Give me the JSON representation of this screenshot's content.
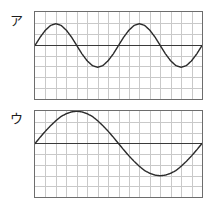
{
  "figure": {
    "background_color": "#ffffff",
    "width": 213,
    "height": 207,
    "panel_count": 2
  },
  "style": {
    "grid_color": "#c9c9c9",
    "border_color": "#6d6d6d",
    "axis_color": "#3a3a3a",
    "wave_color": "#2b2b2b",
    "label_color": "#1c1c1c"
  },
  "panels": [
    {
      "label": "ア",
      "label_x": 10,
      "label_y": 14,
      "box_x": 34,
      "box_y": 11,
      "box_w": 169,
      "box_h": 89,
      "grid_cols": 16,
      "grid_rows": 8,
      "axis_row": 3,
      "chart_data": {
        "type": "line",
        "title": "ア",
        "xlabel": "",
        "ylabel": "",
        "waveform": "sine",
        "cycles": 2,
        "amplitude_cells": 2,
        "phase_deg": 0,
        "baseline_row": 3,
        "xlim": [
          0,
          16
        ],
        "ylim": [
          -3,
          5
        ],
        "grid": true,
        "legend": "none",
        "x": [
          0,
          0.5,
          1,
          1.5,
          2,
          2.5,
          3,
          3.5,
          4,
          4.5,
          5,
          5.5,
          6,
          6.5,
          7,
          7.5,
          8,
          8.5,
          9,
          9.5,
          10,
          10.5,
          11,
          11.5,
          12,
          12.5,
          13,
          13.5,
          14,
          14.5,
          15,
          15.5,
          16
        ],
        "y": [
          0,
          0.77,
          1.41,
          1.85,
          2,
          1.85,
          1.41,
          0.77,
          0,
          -0.77,
          -1.41,
          -1.85,
          -2,
          -1.85,
          -1.41,
          -0.77,
          0,
          0.77,
          1.41,
          1.85,
          2,
          1.85,
          1.41,
          0.77,
          0,
          -0.77,
          -1.41,
          -1.85,
          -2,
          -1.85,
          -1.41,
          -0.77,
          0
        ]
      }
    },
    {
      "label": "ウ",
      "label_x": 10,
      "label_y": 112,
      "box_x": 34,
      "box_y": 110,
      "box_w": 169,
      "box_h": 88,
      "grid_cols": 16,
      "grid_rows": 8,
      "axis_row": 3,
      "chart_data": {
        "type": "line",
        "title": "ウ",
        "xlabel": "",
        "ylabel": "",
        "waveform": "sine",
        "cycles": 1,
        "amplitude_cells": 3,
        "phase_deg": 0,
        "baseline_row": 3,
        "xlim": [
          0,
          16
        ],
        "ylim": [
          -3,
          5
        ],
        "grid": true,
        "legend": "none",
        "x": [
          0,
          0.5,
          1,
          1.5,
          2,
          2.5,
          3,
          3.5,
          4,
          4.5,
          5,
          5.5,
          6,
          6.5,
          7,
          7.5,
          8,
          8.5,
          9,
          9.5,
          10,
          10.5,
          11,
          11.5,
          12,
          12.5,
          13,
          13.5,
          14,
          14.5,
          15,
          15.5,
          16
        ],
        "y": [
          0,
          0.59,
          1.15,
          1.66,
          2.12,
          2.52,
          2.77,
          2.94,
          3,
          2.94,
          2.77,
          2.52,
          2.12,
          1.66,
          1.15,
          0.59,
          0,
          -0.59,
          -1.15,
          -1.66,
          -2.12,
          -2.52,
          -2.77,
          -2.94,
          -3,
          -2.94,
          -2.77,
          -2.52,
          -2.12,
          -1.66,
          -1.15,
          -0.59,
          0
        ]
      }
    }
  ]
}
